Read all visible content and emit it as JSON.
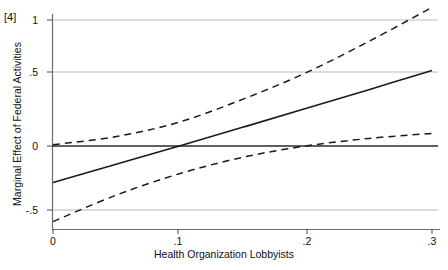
{
  "figure": {
    "panel_tag": "[4]"
  },
  "chart_data": {
    "type": "line",
    "title": "",
    "subtitle": "",
    "xlabel": "Health Organization Lobbyists",
    "ylabel": "Marginal Effect of Federal Activities",
    "xlim": [
      0,
      0.3
    ],
    "ylim": [
      -0.62,
      1.12
    ],
    "grid": true,
    "gridlines_y": [
      1,
      0.5,
      0,
      -0.5
    ],
    "legend": null,
    "legend_position": "none",
    "xticks": [
      0,
      0.1,
      0.2,
      0.3
    ],
    "xtick_labels": [
      "0",
      ".1",
      ".2",
      ".3"
    ],
    "yticks": [
      1,
      0.5,
      0,
      -0.5
    ],
    "ytick_labels": [
      "1",
      ".5",
      "0",
      "-.5"
    ],
    "series": [
      {
        "name": "Marginal effect",
        "style": "solid",
        "color": "#1a1a1a",
        "x": [
          0,
          0.05,
          0.1,
          0.15,
          0.2,
          0.25,
          0.3
        ],
        "values": [
          -0.29,
          -0.145,
          0.0,
          0.148,
          0.297,
          0.447,
          0.6
        ]
      },
      {
        "name": "Upper 95% confidence bound",
        "style": "dashed",
        "color": "#1a1a1a",
        "x": [
          0,
          0.05,
          0.1,
          0.15,
          0.2,
          0.25,
          0.3
        ],
        "values": [
          0.01,
          0.075,
          0.19,
          0.37,
          0.58,
          0.83,
          1.1
        ]
      },
      {
        "name": "Lower 95% confidence bound",
        "style": "dashed",
        "color": "#1a1a1a",
        "x": [
          0,
          0.05,
          0.1,
          0.15,
          0.2,
          0.25,
          0.3
        ],
        "values": [
          -0.6,
          -0.39,
          -0.22,
          -0.09,
          0.0,
          0.06,
          0.1
        ]
      }
    ]
  }
}
